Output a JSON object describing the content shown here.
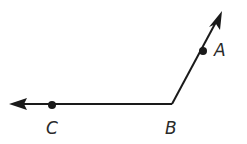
{
  "diagram": {
    "type": "angle",
    "vertex": {
      "label": "B"
    },
    "rays": [
      {
        "name": "ray-BA",
        "from": "B",
        "through": "A"
      },
      {
        "name": "ray-BC",
        "from": "B",
        "through": "C"
      }
    ],
    "points": [
      {
        "label": "A",
        "on": "ray-BA"
      },
      {
        "label": "B",
        "role": "vertex"
      },
      {
        "label": "C",
        "on": "ray-BC"
      }
    ],
    "colors": {
      "stroke": "#1a1a1a",
      "label": "#2a2a2a",
      "background": "#ffffff"
    }
  }
}
